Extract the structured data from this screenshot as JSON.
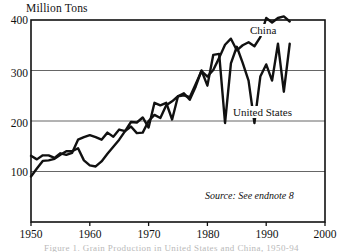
{
  "chart_data": {
    "type": "line",
    "title": "",
    "ylabel": "Million Tons",
    "xlabel": "",
    "ylim": [
      0,
      400
    ],
    "xlim": [
      1950,
      2000
    ],
    "yticks": [
      100,
      200,
      300,
      400
    ],
    "xticks": [
      1950,
      1960,
      1970,
      1980,
      1990,
      2000
    ],
    "grid": "horizontal",
    "legend_position": "inline-annotation",
    "annotations": [
      {
        "text": "China",
        "x": 1990,
        "y": 370
      },
      {
        "text": "United States",
        "x": 1986,
        "y": 212
      },
      {
        "text": "Source: See endnote 8",
        "x": 1987,
        "y": 45
      }
    ],
    "x": [
      1950,
      1951,
      1952,
      1953,
      1954,
      1955,
      1956,
      1957,
      1958,
      1959,
      1960,
      1961,
      1962,
      1963,
      1964,
      1965,
      1966,
      1967,
      1968,
      1969,
      1970,
      1971,
      1972,
      1973,
      1974,
      1975,
      1976,
      1977,
      1978,
      1979,
      1980,
      1981,
      1982,
      1983,
      1984,
      1985,
      1986,
      1987,
      1988,
      1989,
      1990,
      1991,
      1992,
      1993,
      1994
    ],
    "series": [
      {
        "name": "United States",
        "values": [
          131,
          124,
          132,
          132,
          127,
          136,
          133,
          137,
          163,
          168,
          172,
          168,
          163,
          177,
          169,
          183,
          180,
          198,
          197,
          207,
          187,
          236,
          231,
          236,
          203,
          249,
          255,
          242,
          268,
          300,
          270,
          331,
          333,
          196,
          314,
          347,
          315,
          280,
          196,
          288,
          312,
          280,
          353,
          258,
          353
        ]
      },
      {
        "name": "China",
        "values": [
          90,
          106,
          121,
          122,
          125,
          133,
          140,
          140,
          146,
          122,
          112,
          110,
          120,
          135,
          149,
          163,
          180,
          189,
          176,
          177,
          200,
          212,
          206,
          231,
          239,
          249,
          251,
          247,
          273,
          299,
          288,
          301,
          325,
          351,
          363,
          340,
          350,
          356,
          348,
          366,
          404,
          395,
          404,
          407,
          397
        ]
      }
    ],
    "units": "million tons"
  },
  "axis": {
    "y_title": "Million Tons",
    "y_ticks": [
      "400",
      "300",
      "200",
      "100"
    ],
    "x_ticks": [
      "1950",
      "1960",
      "1970",
      "1980",
      "1990",
      "2000"
    ]
  },
  "labels": {
    "china": "China",
    "united_states": "United States",
    "source": "Source: See endnote 8",
    "caption": "Figure 1. Grain Production in United States and China, 1950-94"
  },
  "colors": {
    "line": "#111111",
    "grid": "#555555",
    "frame": "#111111",
    "background": "#ffffff"
  }
}
